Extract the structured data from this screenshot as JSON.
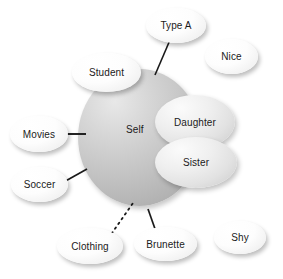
{
  "diagram": {
    "background_color": "#ffffff",
    "core": {
      "label": "Self",
      "shape": "circle",
      "fill": "#c3c3c3"
    },
    "nodes": [
      {
        "id": "type-a",
        "label": "Type A",
        "style": "white",
        "connected": true,
        "connector": "solid"
      },
      {
        "id": "nice",
        "label": "Nice",
        "style": "white",
        "connected": false,
        "connector": "none"
      },
      {
        "id": "student",
        "label": "Student",
        "style": "white",
        "connected": false,
        "connector": "overlap"
      },
      {
        "id": "daughter",
        "label": "Daughter",
        "style": "grey",
        "connected": false,
        "connector": "overlap"
      },
      {
        "id": "sister",
        "label": "Sister",
        "style": "grey",
        "connected": false,
        "connector": "overlap"
      },
      {
        "id": "movies",
        "label": "Movies",
        "style": "white",
        "connected": true,
        "connector": "solid"
      },
      {
        "id": "soccer",
        "label": "Soccer",
        "style": "white",
        "connected": true,
        "connector": "solid"
      },
      {
        "id": "clothing",
        "label": "Clothing",
        "style": "white",
        "connected": true,
        "connector": "dotted"
      },
      {
        "id": "brunette",
        "label": "Brunette",
        "style": "white",
        "connected": true,
        "connector": "solid"
      },
      {
        "id": "shy",
        "label": "Shy",
        "style": "white",
        "connected": false,
        "connector": "none"
      }
    ]
  }
}
